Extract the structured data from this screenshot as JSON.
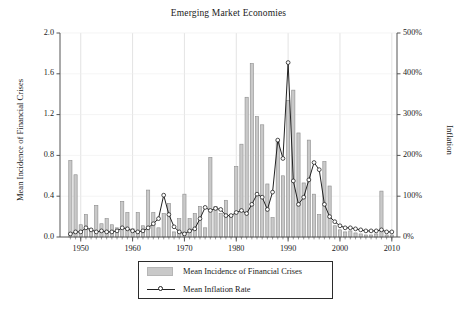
{
  "chart_data": {
    "type": "bar",
    "title": "Emerging Market Economies",
    "xlabel": "",
    "ylabel": "Mean Incidence of Financial Crises",
    "ylabel_right": "Inflation",
    "xlim": [
      1946,
      2011
    ],
    "ylim": [
      0.0,
      2.0
    ],
    "ylim_right": [
      0,
      500
    ],
    "grid": "vertical-at-decades",
    "legend_position": "below-axes-center",
    "x_ticks": [
      1950,
      1960,
      1970,
      1980,
      1990,
      2000,
      2010
    ],
    "x_tick_labels": [
      "1950",
      "1960",
      "1970",
      "1980",
      "1990",
      "2000",
      "2010"
    ],
    "y_ticks_left": [
      0.0,
      0.4,
      0.8,
      1.2,
      1.6,
      2.0
    ],
    "y_tick_labels_left": [
      "0.0",
      "0.4",
      "0.8",
      "1.2",
      "1.6",
      "2.0"
    ],
    "y_ticks_right": [
      0,
      100,
      200,
      300,
      400,
      500
    ],
    "y_tick_labels_right": [
      "0%",
      "100%",
      "200%",
      "300%",
      "400%",
      "500%"
    ],
    "x": [
      1948,
      1949,
      1950,
      1951,
      1952,
      1953,
      1954,
      1955,
      1956,
      1957,
      1958,
      1959,
      1960,
      1961,
      1962,
      1963,
      1964,
      1965,
      1966,
      1967,
      1968,
      1969,
      1970,
      1971,
      1972,
      1973,
      1974,
      1975,
      1976,
      1977,
      1978,
      1979,
      1980,
      1981,
      1982,
      1983,
      1984,
      1985,
      1986,
      1987,
      1988,
      1989,
      1990,
      1991,
      1992,
      1993,
      1994,
      1995,
      1996,
      1997,
      1998,
      1999,
      2000,
      2001,
      2002,
      2003,
      2004,
      2005,
      2006,
      2007,
      2008,
      2009,
      2010
    ],
    "series": [
      {
        "name": "Mean Incidence of Financial Crises",
        "type": "bar",
        "axis": "left",
        "color": "#c9c9c9",
        "edge_color": "#8c8c8c",
        "values": [
          0.75,
          0.61,
          0.12,
          0.22,
          0.08,
          0.31,
          0.13,
          0.18,
          0.12,
          0.09,
          0.35,
          0.24,
          0.08,
          0.24,
          0.11,
          0.46,
          0.24,
          0.09,
          0.23,
          0.33,
          0.05,
          0.18,
          0.42,
          0.18,
          0.23,
          0.3,
          0.09,
          0.78,
          0.3,
          0.23,
          0.36,
          0.22,
          0.69,
          0.91,
          1.37,
          1.7,
          1.18,
          1.1,
          0.52,
          0.19,
          0.95,
          0.6,
          1.34,
          1.44,
          1.02,
          0.53,
          0.95,
          0.42,
          0.22,
          0.74,
          0.5,
          0.11,
          0.07,
          0.05,
          0.06,
          0.04,
          0.03,
          0.02,
          0.02,
          0.03,
          0.45,
          0.02,
          0.02
        ]
      },
      {
        "name": "Mean Inflation Rate",
        "type": "line",
        "axis": "right",
        "color": "#222222",
        "marker": "open-circle",
        "values_left_scale": [
          0.03,
          0.05,
          0.05,
          0.09,
          0.07,
          0.05,
          0.06,
          0.05,
          0.05,
          0.06,
          0.09,
          0.08,
          0.06,
          0.05,
          0.06,
          0.09,
          0.13,
          0.18,
          0.41,
          0.22,
          0.1,
          0.05,
          0.03,
          0.06,
          0.08,
          0.18,
          0.29,
          0.26,
          0.28,
          0.27,
          0.21,
          0.21,
          0.24,
          0.26,
          0.23,
          0.32,
          0.42,
          0.39,
          0.27,
          0.44,
          0.95,
          0.77,
          1.71,
          0.55,
          0.32,
          0.39,
          0.56,
          0.73,
          0.66,
          0.32,
          0.2,
          0.15,
          0.11,
          0.09,
          0.09,
          0.08,
          0.07,
          0.06,
          0.06,
          0.06,
          0.07,
          0.05,
          0.05
        ],
        "values_percent": [
          8,
          13,
          13,
          22,
          18,
          13,
          15,
          13,
          13,
          15,
          22,
          20,
          15,
          13,
          15,
          22,
          33,
          45,
          103,
          55,
          25,
          13,
          8,
          15,
          20,
          45,
          73,
          65,
          70,
          68,
          53,
          53,
          60,
          65,
          58,
          80,
          105,
          98,
          68,
          110,
          238,
          193,
          428,
          138,
          80,
          98,
          140,
          183,
          165,
          80,
          50,
          38,
          28,
          23,
          23,
          20,
          18,
          15,
          15,
          15,
          18,
          13,
          13
        ]
      }
    ]
  },
  "legend": {
    "items": [
      {
        "label": "Mean Incidence of Financial Crises",
        "marker": "bar-swatch"
      },
      {
        "label": "Mean Inflation Rate",
        "marker": "line-circle"
      }
    ]
  },
  "colors": {
    "bar_fill": "#c9c9c9",
    "bar_edge": "#8c8c8c",
    "line": "#222222",
    "axis": "#555555",
    "grid": "#dcdcdc",
    "text": "#1a1a1a",
    "background": "#ffffff"
  }
}
